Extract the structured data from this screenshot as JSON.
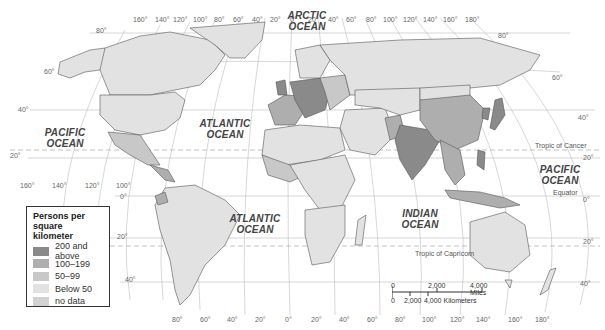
{
  "legend": {
    "title": "Persons per square kilometer",
    "items": [
      {
        "label": "200 and above",
        "color": "#8a8a8a"
      },
      {
        "label": "100–199",
        "color": "#aeaeae"
      },
      {
        "label": "50–99",
        "color": "#c8c8c8"
      },
      {
        "label": "Below 50",
        "color": "#e2e2e2"
      },
      {
        "label": "no data",
        "color": "#d2d2d2"
      }
    ]
  },
  "oceans": {
    "arctic": "ARCTIC OCEAN",
    "pacific_west": "PACIFIC OCEAN",
    "pacific_east": "PACIFIC OCEAN",
    "atlantic_north": "ATLANTIC OCEAN",
    "atlantic_south": "ATLANTIC OCEAN",
    "indian": "INDIAN OCEAN"
  },
  "lines": {
    "tropic_cancer": "Tropic of Cancer",
    "tropic_capricorn": "Tropic of Capricorn",
    "equator": "Equator"
  },
  "longitude_top": [
    "160°",
    "140°",
    "120°",
    "100°",
    "80°",
    "60°",
    "40°",
    "20°",
    "0°",
    "20°",
    "40°",
    "60°",
    "80°",
    "100°",
    "120°",
    "140°",
    "160°",
    "180°"
  ],
  "longitude_mid": [
    "160°",
    "140°",
    "120°",
    "100°"
  ],
  "longitude_bottom": [
    "80°",
    "60°",
    "40°",
    "20°",
    "0°",
    "20°",
    "40°",
    "60°",
    "80°",
    "100°",
    "120°",
    "140°",
    "160°",
    "180°"
  ],
  "latitude_left": [
    "80°",
    "60°",
    "40°",
    "20°",
    "0°",
    "20°",
    "40°"
  ],
  "latitude_right": [
    "80°",
    "60°",
    "40°",
    "20°",
    "0°",
    "20°",
    "40°"
  ],
  "scale": {
    "miles_zero": "0",
    "miles_mid": "2,000",
    "miles_end": "4,000 Miles",
    "km_zero": "0",
    "km_mid": "2,000",
    "km_end": "4,000 Kilometers"
  }
}
